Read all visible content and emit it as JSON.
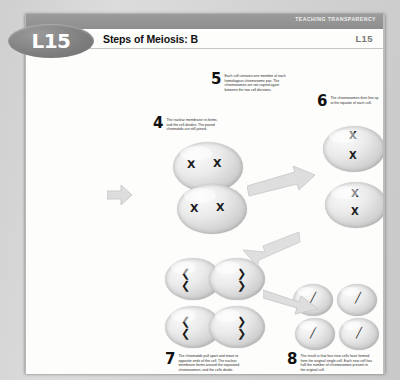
{
  "page": {
    "header_label": "TEACHING TRANSPARENCY",
    "title": "Steps of Meiosis: B",
    "code": "L15",
    "badge": "L15"
  },
  "steps": [
    {
      "number": "4",
      "text": "The nuclear membrane re-forms, and the cell divides. The paired chromatids are still joined."
    },
    {
      "number": "5",
      "text": "Each cell contains one member of each homologous chromosome pair. The chromosomes are not copied again between the two cell divisions."
    },
    {
      "number": "6",
      "text": "The chromosomes then line up at the equator of each cell."
    },
    {
      "number": "7",
      "text": "The chromatids pull apart and move to opposite ends of the cell. The nuclear membrane forms around the separated chromosomes, and the cells divide."
    },
    {
      "number": "8",
      "text": "The result is that four new cells have formed from the original single cell. Each new cell has half the number of chromosomes present in the original cell."
    }
  ],
  "chromosomes": {
    "paired_glyph": "X",
    "separated_glyph_left": "❮",
    "separated_glyph_right": "❯",
    "single_glyph": "╱"
  },
  "colors": {
    "header_bar": "#8e8e8e",
    "badge": "#7e7e7e",
    "code_text": "#777777",
    "page_background": "#fdfdfc",
    "scan_background": "#d4d4d4",
    "arrow": "#d8d8d8"
  }
}
